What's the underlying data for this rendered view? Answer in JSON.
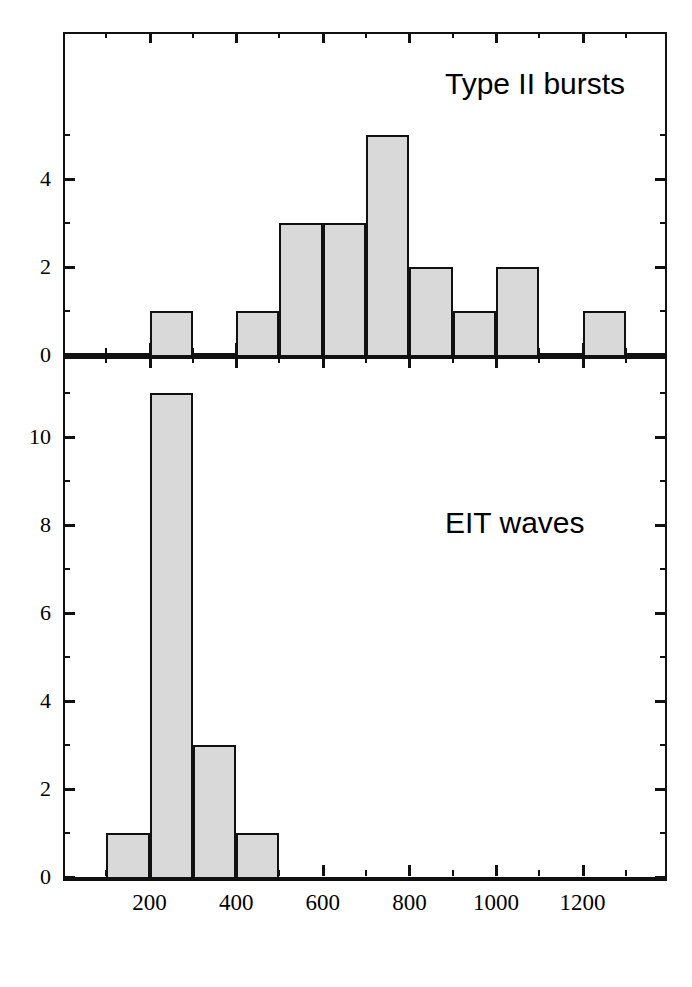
{
  "figure": {
    "background": "#ffffff",
    "bar_fill": "#d9d9d9",
    "bar_edge": "#111111",
    "axis_color": "#111111",
    "width": 692,
    "height": 987
  },
  "chart_data": [
    {
      "type": "bar",
      "subtype": "histogram",
      "panel": "top",
      "title": "",
      "annotation": "Type II bursts",
      "xlabel": "",
      "ylabel": "",
      "xlim": [
        0,
        1395
      ],
      "ylim": [
        0,
        5.6
      ],
      "grid": false,
      "legend": "none",
      "bin_width": 100,
      "xticks_major": [
        200,
        400,
        600,
        800,
        1000,
        1200
      ],
      "xticks_minor": [
        100,
        300,
        500,
        700,
        900,
        1100,
        1300
      ],
      "xticklabels": [
        "",
        "",
        "",
        "",
        "",
        ""
      ],
      "yticks_major": [
        0,
        2,
        4
      ],
      "yticks_minor": [
        1,
        3,
        5
      ],
      "yticklabels": [
        "0",
        "2",
        "4"
      ],
      "bins": [
        {
          "x0": 200,
          "x1": 300,
          "count": 1
        },
        {
          "x0": 300,
          "x1": 400,
          "count": 0
        },
        {
          "x0": 400,
          "x1": 500,
          "count": 1
        },
        {
          "x0": 500,
          "x1": 600,
          "count": 3
        },
        {
          "x0": 600,
          "x1": 700,
          "count": 3
        },
        {
          "x0": 700,
          "x1": 800,
          "count": 5
        },
        {
          "x0": 800,
          "x1": 900,
          "count": 2
        },
        {
          "x0": 900,
          "x1": 1000,
          "count": 1
        },
        {
          "x0": 1000,
          "x1": 1100,
          "count": 2
        },
        {
          "x0": 1100,
          "x1": 1200,
          "count": 0
        },
        {
          "x0": 1200,
          "x1": 1300,
          "count": 1
        }
      ],
      "categories": [
        "200-300",
        "300-400",
        "400-500",
        "500-600",
        "600-700",
        "700-800",
        "800-900",
        "900-1000",
        "1000-1100",
        "1100-1200",
        "1200-1300"
      ],
      "values": [
        1,
        0,
        1,
        3,
        3,
        5,
        2,
        1,
        2,
        0,
        1
      ]
    },
    {
      "type": "bar",
      "subtype": "histogram",
      "panel": "bottom",
      "title": "",
      "annotation": "EIT waves",
      "xlabel": "",
      "ylabel": "",
      "xlim": [
        0,
        1395
      ],
      "ylim": [
        0,
        11.8
      ],
      "grid": false,
      "legend": "none",
      "bin_width": 100,
      "xticks_major": [
        200,
        400,
        600,
        800,
        1000,
        1200
      ],
      "xticks_minor": [
        100,
        300,
        500,
        700,
        900,
        1100,
        1300
      ],
      "xticklabels": [
        "200",
        "400",
        "600",
        "800",
        "1000",
        "1200"
      ],
      "yticks_major": [
        0,
        2,
        4,
        6,
        8,
        10
      ],
      "yticks_minor": [
        1,
        3,
        5,
        7,
        9,
        11
      ],
      "yticklabels": [
        "0",
        "2",
        "4",
        "6",
        "8",
        "10"
      ],
      "bins": [
        {
          "x0": 100,
          "x1": 200,
          "count": 1
        },
        {
          "x0": 200,
          "x1": 300,
          "count": 11
        },
        {
          "x0": 300,
          "x1": 400,
          "count": 3
        },
        {
          "x0": 400,
          "x1": 500,
          "count": 1
        }
      ],
      "categories": [
        "100-200",
        "200-300",
        "300-400",
        "400-500"
      ],
      "values": [
        1,
        11,
        3,
        1
      ]
    }
  ]
}
